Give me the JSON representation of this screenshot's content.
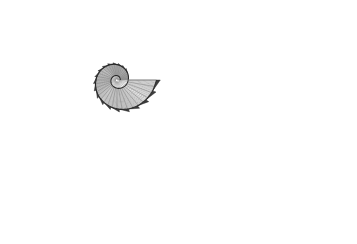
{
  "figure": {
    "title": "",
    "type": "logarithmic spiral shell diagram",
    "width": 357,
    "height": 244,
    "background": "#ffffff",
    "colors": {
      "grid_line": "#8a8a8a",
      "spiral_line": "#2a2a2a",
      "tooth_fill": "#3c3c3c",
      "tooth_stroke": "#1e1e1e"
    },
    "spiral": {
      "center_x": 117,
      "center_y": 80,
      "start_radius": 3.2,
      "growth_per_radian": 0.2,
      "theta_start_deg": 0,
      "turns_deg": 720,
      "ccw": true
    },
    "grid": {
      "concentric_count": 24,
      "radial_count": 36
    },
    "teeth": {
      "count": 19,
      "size_ratio": 0.16
    },
    "labels": []
  }
}
